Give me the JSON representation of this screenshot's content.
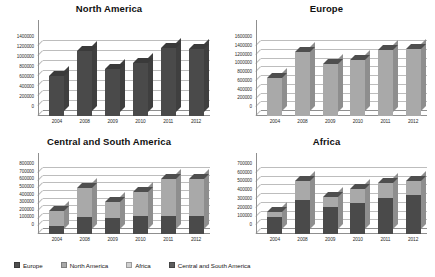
{
  "legend": {
    "items": [
      {
        "label": "Europe",
        "color": "#4f4f4f"
      },
      {
        "label": "North America",
        "color": "#a8a8a8"
      },
      {
        "label": "Africa",
        "color": "#d0d0d0"
      },
      {
        "label": "Central and  South America",
        "color": "#5d5d5d"
      }
    ]
  },
  "palette": {
    "dark": "#4a4a4a",
    "dark_top": "#3a3a3a",
    "dark_side": "#3f3f3f",
    "light": "#a9a9a9",
    "light_top": "#4e4e4e",
    "light_side": "#8e8e8e",
    "mid": "#7d7d7d",
    "grid": "#bdbdbd",
    "axis": "#8f8f8f"
  },
  "chart_data": [
    {
      "type": "bar",
      "title": "North America",
      "xlabel": "",
      "ylabel": "",
      "categories": [
        "2004",
        "2008",
        "2009",
        "2010",
        "2011",
        "2012"
      ],
      "ylim": [
        0,
        1400000
      ],
      "ytick_step": 200000,
      "yticks": [
        0,
        200000,
        400000,
        600000,
        800000,
        1000000,
        1200000,
        1400000
      ],
      "grid": true,
      "legend_position": "bottom-shared",
      "series": [
        {
          "name": "North America",
          "values": [
            800000,
            1300000,
            950000,
            1070000,
            1370000,
            1350000
          ]
        }
      ]
    },
    {
      "type": "bar",
      "title": "Europe",
      "xlabel": "",
      "ylabel": "",
      "categories": [
        "2004",
        "2008",
        "2009",
        "2010",
        "2011",
        "2012"
      ],
      "ylim": [
        0,
        1600000
      ],
      "ytick_step": 200000,
      "yticks": [
        0,
        200000,
        400000,
        600000,
        800000,
        1000000,
        1200000,
        1400000,
        1600000
      ],
      "grid": true,
      "legend_position": "bottom-shared",
      "series": [
        {
          "name": "Europe",
          "values": [
            870000,
            1470000,
            1200000,
            1280000,
            1520000,
            1530000
          ]
        }
      ]
    },
    {
      "type": "bar",
      "title": "Central and South America",
      "xlabel": "",
      "ylabel": "",
      "categories": [
        "2004",
        "2008",
        "2009",
        "2010",
        "2011",
        "2012"
      ],
      "ylim": [
        0,
        800000
      ],
      "ytick_step": 100000,
      "yticks": [
        0,
        100000,
        200000,
        300000,
        400000,
        500000,
        600000,
        700000,
        800000
      ],
      "grid": true,
      "stacked": true,
      "legend_position": "bottom-shared",
      "series": [
        {
          "name": "base",
          "values": [
            110000,
            225000,
            215000,
            230000,
            240000,
            240000
          ]
        },
        {
          "name": "top",
          "values": [
            190000,
            375000,
            200000,
            315000,
            480000,
            480000
          ]
        }
      ]
    },
    {
      "type": "bar",
      "title": "Africa",
      "xlabel": "",
      "ylabel": "",
      "categories": [
        "2004",
        "2008",
        "2009",
        "2010",
        "2011",
        "2012"
      ],
      "ylim": [
        0,
        700000
      ],
      "ytick_step": 100000,
      "yticks": [
        0,
        100000,
        200000,
        300000,
        400000,
        500000,
        600000,
        700000
      ],
      "grid": true,
      "stacked": true,
      "legend_position": "bottom-shared",
      "series": [
        {
          "name": "base",
          "values": [
            195000,
            390000,
            305000,
            360000,
            410000,
            450000
          ]
        },
        {
          "name": "top",
          "values": [
            55000,
            220000,
            120000,
            160000,
            180000,
            160000
          ]
        }
      ]
    }
  ]
}
